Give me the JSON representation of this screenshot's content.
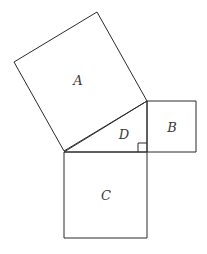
{
  "diagram": {
    "type": "pythagorean-squares",
    "colors": {
      "stroke": "#2b2b2b",
      "label": "#3a3a3a",
      "background": "#ffffff"
    },
    "shapes": [
      {
        "id": "A",
        "label": "A",
        "kind": "square-on-hypotenuse",
        "points": [
          [
            64,
            151
          ],
          [
            14,
            62
          ],
          [
            97,
            12
          ],
          [
            147,
            101
          ]
        ],
        "label_pos": [
          78,
          80
        ]
      },
      {
        "id": "B",
        "label": "B",
        "kind": "square-on-vertical-leg",
        "points": [
          [
            147,
            101
          ],
          [
            196,
            101
          ],
          [
            196,
            152
          ],
          [
            147,
            152
          ]
        ],
        "label_pos": [
          172,
          127
        ]
      },
      {
        "id": "C",
        "label": "C",
        "kind": "square-on-horizontal-leg",
        "points": [
          [
            64,
            152
          ],
          [
            147,
            152
          ],
          [
            147,
            238
          ],
          [
            64,
            238
          ]
        ],
        "label_pos": [
          106,
          195
        ]
      },
      {
        "id": "D",
        "label": "D",
        "kind": "right-triangle",
        "points": [
          [
            64,
            152
          ],
          [
            147,
            101
          ],
          [
            147,
            152
          ]
        ],
        "label_pos": [
          124,
          134
        ]
      }
    ],
    "right_angle_marker": {
      "x": 138,
      "y": 143,
      "size": 9
    }
  }
}
